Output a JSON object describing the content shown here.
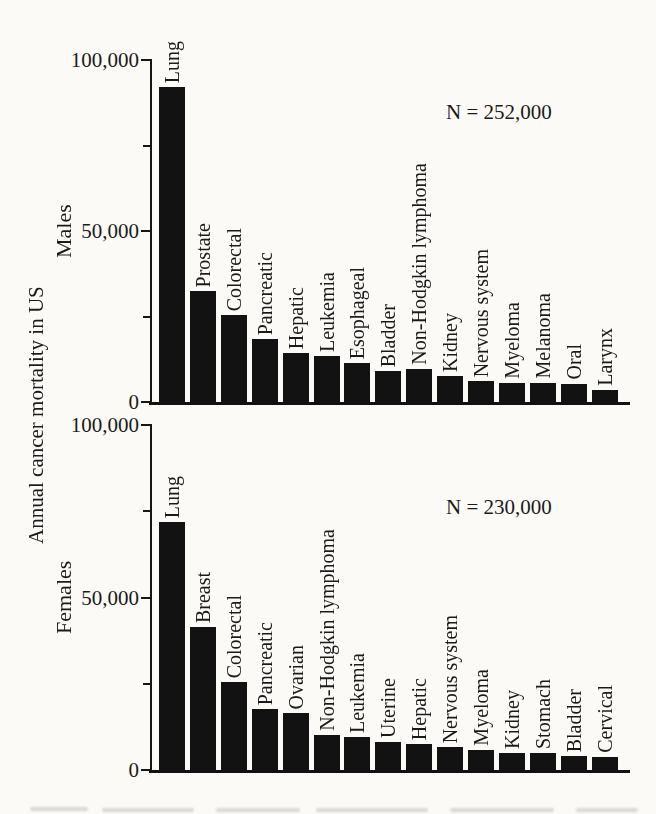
{
  "figure": {
    "y_axis_title": "Annual cancer mortality in US",
    "colors": {
      "bar": "#121212",
      "text": "#1a1a1a",
      "axis": "#161616",
      "background": "#fbfaf7"
    }
  },
  "chart_data": [
    {
      "type": "bar",
      "group_label": "Males",
      "annotation": "N = 252,000",
      "title": "",
      "xlabel": "",
      "ylabel": "Annual cancer mortality in US",
      "ylim": [
        0,
        100000
      ],
      "grid": false,
      "yticks": [
        {
          "value": 0,
          "label": "0"
        },
        {
          "value": 50000,
          "label": "50,000"
        },
        {
          "value": 100000,
          "label": "100,000"
        }
      ],
      "minor_yticks": [
        25000,
        75000
      ],
      "categories": [
        "Lung",
        "Prostate",
        "Colorectal",
        "Pancreatic",
        "Hepatic",
        "Leukemia",
        "Esophageal",
        "Bladder",
        "Non-Hodgkin lymphoma",
        "Kidney",
        "Nervous system",
        "Myeloma",
        "Melanoma",
        "Oral",
        "Larynx"
      ],
      "values": [
        92000,
        32500,
        25500,
        18500,
        14300,
        13400,
        11300,
        9200,
        9700,
        7500,
        6100,
        5600,
        5500,
        5200,
        3500
      ]
    },
    {
      "type": "bar",
      "group_label": "Females",
      "annotation": "N = 230,000",
      "title": "",
      "xlabel": "",
      "ylabel": "Annual cancer mortality in US",
      "ylim": [
        0,
        100000
      ],
      "grid": false,
      "yticks": [
        {
          "value": 0,
          "label": "0"
        },
        {
          "value": 50000,
          "label": "50,000"
        },
        {
          "value": 100000,
          "label": "100,000"
        }
      ],
      "minor_yticks": [
        25000,
        75000
      ],
      "categories": [
        "Lung",
        "Breast",
        "Colorectal",
        "Pancreatic",
        "Ovarian",
        "Non-Hodgkin lymphoma",
        "Leukemia",
        "Uterine",
        "Hepatic",
        "Nervous system",
        "Myeloma",
        "Kidney",
        "Stomach",
        "Bladder",
        "Cervical"
      ],
      "values": [
        72000,
        41500,
        25500,
        17800,
        16600,
        10000,
        9600,
        8100,
        7500,
        6700,
        5800,
        5000,
        4900,
        4100,
        3800
      ]
    }
  ]
}
